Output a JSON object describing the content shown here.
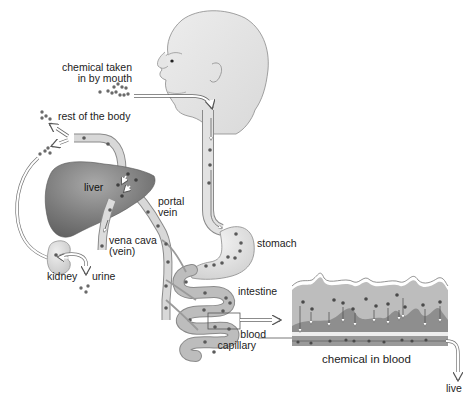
{
  "diagram": {
    "type": "anatomical-flow",
    "labels": {
      "chemical_taken": "chemical taken",
      "in_by_mouth": "in by mouth",
      "rest_of_body": "rest of the body",
      "liver": "liver",
      "portal": "portal",
      "vein": "vein",
      "vena_cava": "vena cava",
      "vena_cava_sub": "(vein)",
      "kidney": "kidney",
      "urine": "urine",
      "stomach": "stomach",
      "intestine": "intestine",
      "blood": "blood",
      "capillary": "capillary",
      "chemical_in_blood": "chemical in blood",
      "to_liver_truncated": "live"
    },
    "flow": [
      "mouth",
      "esophagus",
      "stomach",
      "intestine",
      "blood capillary",
      "portal vein",
      "liver",
      "vena cava",
      "rest of the body",
      "kidney",
      "urine"
    ],
    "colors": {
      "organ_dark": "#6e6e6e",
      "organ_mid": "#a8a8a8",
      "organ_light": "#d6d6d6",
      "skin": "#e4e4e4",
      "vessel": "#cfcfcf",
      "particle": "#5a5a5a",
      "stroke": "#777777"
    }
  }
}
